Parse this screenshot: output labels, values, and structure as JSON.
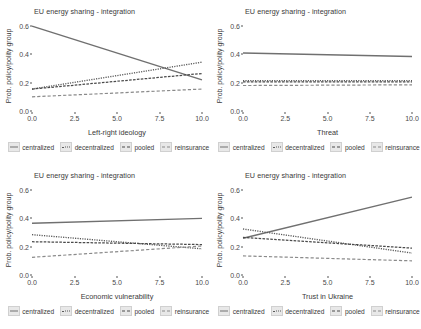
{
  "figure": {
    "background": "#ffffff",
    "line_color_solid": "#707070",
    "line_color_dark": "#4a4a4a",
    "line_color_mid": "#5a5a5a",
    "line_color_light": "#8a8a8a"
  },
  "legend": {
    "items": [
      {
        "label": "centralized",
        "style": "solid"
      },
      {
        "label": "decentralized",
        "style": "dotted"
      },
      {
        "label": "pooled",
        "style": "dashdot"
      },
      {
        "label": "reinsurance",
        "style": "dashed"
      }
    ]
  },
  "chart_data": [
    {
      "type": "line",
      "title": "EU energy sharing - integration",
      "xlabel": "Left-right ideology",
      "ylabel": "Prob. policy/polity group",
      "xlim": [
        0,
        10
      ],
      "ylim": [
        0,
        0.65
      ],
      "xticks": [
        "0.0",
        "2.5",
        "5.0",
        "7.5",
        "10.0"
      ],
      "xtick_values": [
        0,
        2.5,
        5,
        7.5,
        10
      ],
      "yticks": [
        "0.0",
        "0.2",
        "0.4",
        "0.6"
      ],
      "ytick_values": [
        0,
        0.2,
        0.4,
        0.6
      ],
      "grid": false,
      "legend_position": "bottom",
      "x": [
        0,
        10
      ],
      "series": [
        {
          "name": "centralized",
          "style": "solid",
          "values": [
            0.6,
            0.22
          ]
        },
        {
          "name": "decentralized",
          "style": "dotted",
          "values": [
            0.155,
            0.345
          ]
        },
        {
          "name": "pooled",
          "style": "dashdot",
          "values": [
            0.155,
            0.265
          ]
        },
        {
          "name": "reinsurance",
          "style": "dashed",
          "values": [
            0.1,
            0.155
          ]
        }
      ]
    },
    {
      "type": "line",
      "title": "EU energy sharing - integration",
      "xlabel": "Threat",
      "ylabel": "Prob. policy/polity group",
      "xlim": [
        0,
        10
      ],
      "ylim": [
        0,
        0.65
      ],
      "xticks": [
        "0.0",
        "2.5",
        "5.0",
        "7.5",
        "10.0"
      ],
      "xtick_values": [
        0,
        2.5,
        5,
        7.5,
        10
      ],
      "yticks": [
        "0.0",
        "0.2",
        "0.4",
        "0.6"
      ],
      "ytick_values": [
        0,
        0.2,
        0.4,
        0.6
      ],
      "grid": false,
      "legend_position": "bottom",
      "x": [
        0,
        10
      ],
      "series": [
        {
          "name": "centralized",
          "style": "solid",
          "values": [
            0.41,
            0.385
          ]
        },
        {
          "name": "decentralized",
          "style": "dotted",
          "values": [
            0.215,
            0.215
          ]
        },
        {
          "name": "pooled",
          "style": "dashdot",
          "values": [
            0.205,
            0.205
          ]
        },
        {
          "name": "reinsurance",
          "style": "dashed",
          "values": [
            0.18,
            0.185
          ]
        }
      ]
    },
    {
      "type": "line",
      "title": "EU energy sharing - integration",
      "xlabel": "Economic vulnerability",
      "ylabel": "Prob. policy/polity group",
      "xlim": [
        0,
        10
      ],
      "ylim": [
        0,
        0.65
      ],
      "xticks": [
        "0.0",
        "2.5",
        "5.0",
        "7.5",
        "10.0"
      ],
      "xtick_values": [
        0,
        2.5,
        5,
        7.5,
        10
      ],
      "yticks": [
        "0.0",
        "0.2",
        "0.4",
        "0.6"
      ],
      "ytick_values": [
        0,
        0.2,
        0.4,
        0.6
      ],
      "grid": false,
      "legend_position": "bottom",
      "x": [
        0,
        10
      ],
      "series": [
        {
          "name": "centralized",
          "style": "solid",
          "values": [
            0.365,
            0.4
          ]
        },
        {
          "name": "decentralized",
          "style": "dotted",
          "values": [
            0.285,
            0.185
          ]
        },
        {
          "name": "pooled",
          "style": "dashdot",
          "values": [
            0.235,
            0.215
          ]
        },
        {
          "name": "reinsurance",
          "style": "dashed",
          "values": [
            0.125,
            0.205
          ]
        }
      ]
    },
    {
      "type": "line",
      "title": "EU energy sharing - integration",
      "xlabel": "Trust in Ukraine",
      "ylabel": "Prob. policy/polity group",
      "xlim": [
        0,
        10
      ],
      "ylim": [
        0,
        0.65
      ],
      "xticks": [
        "0.0",
        "2.5",
        "5.0",
        "7.5",
        "10.0"
      ],
      "xtick_values": [
        0,
        2.5,
        5,
        7.5,
        10
      ],
      "yticks": [
        "0.0",
        "0.2",
        "0.4",
        "0.6"
      ],
      "ytick_values": [
        0,
        0.2,
        0.4,
        0.6
      ],
      "grid": false,
      "legend_position": "bottom",
      "x": [
        0,
        10
      ],
      "series": [
        {
          "name": "centralized",
          "style": "solid",
          "values": [
            0.26,
            0.55
          ]
        },
        {
          "name": "decentralized",
          "style": "dotted",
          "values": [
            0.325,
            0.155
          ]
        },
        {
          "name": "pooled",
          "style": "dashdot",
          "values": [
            0.265,
            0.19
          ]
        },
        {
          "name": "reinsurance",
          "style": "dashed",
          "values": [
            0.135,
            0.1
          ]
        }
      ]
    }
  ]
}
